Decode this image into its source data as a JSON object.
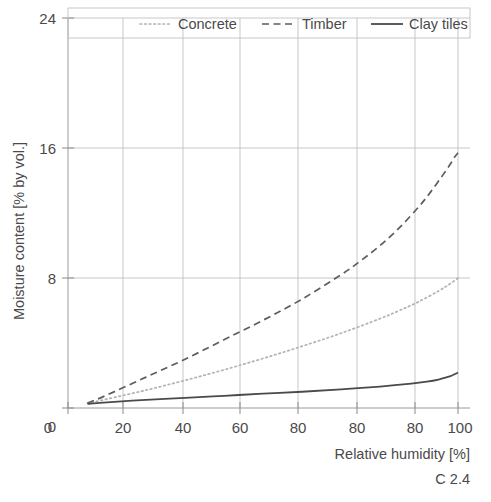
{
  "caption": "C 2.4",
  "chart_data": {
    "type": "line",
    "title": "",
    "xlabel": "Relative humidity [%]",
    "ylabel": "Moisture content [% by vol.]",
    "xlim": [
      0,
      105
    ],
    "ylim": [
      0,
      24
    ],
    "xticks": [
      0,
      20,
      40,
      60,
      80,
      80,
      80,
      100
    ],
    "xtick_labels": [
      "0",
      "20",
      "40",
      "60",
      "80",
      "80",
      "80",
      "100"
    ],
    "xtick_positions": [
      0,
      20,
      40,
      60,
      80,
      90,
      100,
      105
    ],
    "yticks": [
      0,
      8,
      16,
      24
    ],
    "ytick_labels": [
      "0",
      "8",
      "16",
      "24"
    ],
    "grid": true,
    "grid_axis": "both",
    "legend_position": "top",
    "series": [
      {
        "name": "Concrete",
        "style": "dotted",
        "color": "#b2b2b2",
        "x": [
          5,
          10,
          20,
          30,
          40,
          50,
          60,
          70,
          80,
          85,
          90,
          95,
          98,
          100
        ],
        "values": [
          0.3,
          0.55,
          1.1,
          1.7,
          2.35,
          3.05,
          3.8,
          4.6,
          5.5,
          6.0,
          6.55,
          7.2,
          7.65,
          8.0
        ]
      },
      {
        "name": "Timber",
        "style": "dashed",
        "color": "#5d5d5d",
        "x": [
          5,
          10,
          20,
          30,
          40,
          50,
          60,
          70,
          75,
          80,
          85,
          90,
          93,
          96,
          98,
          99,
          100
        ],
        "values": [
          0.3,
          0.8,
          1.9,
          3.0,
          4.2,
          5.4,
          6.7,
          8.2,
          9.05,
          10.0,
          11.1,
          12.4,
          13.3,
          14.3,
          15.0,
          15.4,
          15.7
        ]
      },
      {
        "name": "Clay tiles",
        "style": "solid",
        "color": "#4a4a4a",
        "x": [
          5,
          10,
          20,
          30,
          40,
          50,
          60,
          70,
          80,
          88,
          92,
          95,
          97,
          98.5,
          99.5,
          100
        ],
        "values": [
          0.25,
          0.35,
          0.5,
          0.62,
          0.75,
          0.88,
          1.0,
          1.15,
          1.32,
          1.5,
          1.62,
          1.75,
          1.88,
          2.0,
          2.12,
          2.18
        ]
      }
    ]
  },
  "legend": {
    "items": [
      {
        "label": "Concrete"
      },
      {
        "label": "Timber"
      },
      {
        "label": "Clay tiles"
      }
    ]
  }
}
